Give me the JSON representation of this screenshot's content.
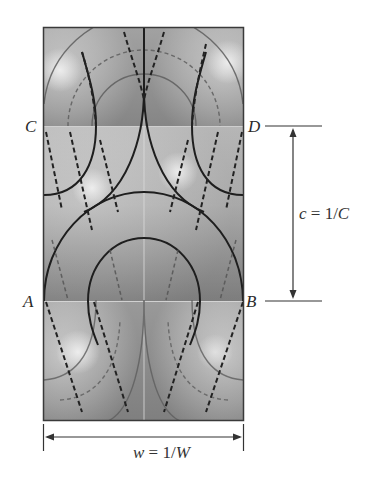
{
  "figure": {
    "corner_labels": {
      "A": "A",
      "B": "B",
      "C": "C",
      "D": "D"
    },
    "height_dimension": {
      "var": "c",
      "eq": " = 1/",
      "cap": "C",
      "full_text": "c = 1/C"
    },
    "width_dimension": {
      "var": "w",
      "eq": " = 1/",
      "cap": "W",
      "full_text": "w = 1/W"
    },
    "colors": {
      "frame": "#3a3a3a",
      "solid_contour": "#1e1e1e",
      "dashed_contour": "#2a2a2a",
      "faint_contour": "#5a5a5a",
      "shade_light": "#d8d8d8",
      "shade_dark": "#7a7a7a"
    }
  }
}
